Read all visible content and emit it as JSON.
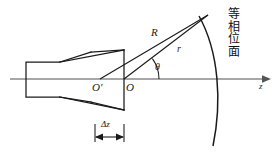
{
  "figure": {
    "type": "horn-antenna-phase-front-diagram",
    "background_color": "#ffffff",
    "line_color": "#1a1a1a",
    "axis_color": "#808080",
    "labels": {
      "phase_center_inner": "O'",
      "aperture_center": "O",
      "ray_long": "R",
      "ray_short": "r",
      "angle": "θ",
      "axis": "z",
      "delta_z": "Δz"
    },
    "annotation_cjk": {
      "full_text": "等相位面",
      "meaning_chars": [
        "等",
        "相",
        "位",
        "面"
      ],
      "char_1": "等",
      "char_2": "相",
      "char_3": "位",
      "char_4": "面"
    },
    "geometry": {
      "axis_y": 79,
      "axis_x_start": 10,
      "axis_x_end": 268,
      "waveguide": {
        "x1": 26,
        "y1": 62,
        "x2": 56,
        "y2": 97
      },
      "horn_aperture_x": 124,
      "horn_top_y": 50,
      "horn_bottom_y": 110,
      "apex": {
        "x": 208,
        "y": 15
      },
      "o_prime": {
        "x": 100,
        "y": 79
      },
      "o": {
        "x": 124,
        "y": 79
      },
      "arc_top": {
        "x": 199,
        "y": 16
      },
      "arc_bottom": {
        "x": 213,
        "y": 146
      },
      "delta_z_left": 95,
      "delta_z_right": 124,
      "delta_z_y": 133
    }
  }
}
